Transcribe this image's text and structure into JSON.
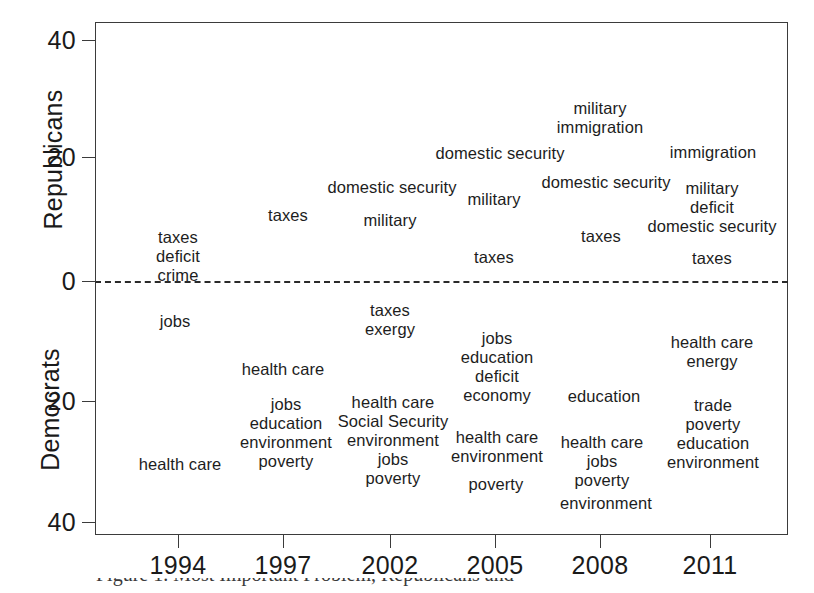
{
  "chart_data": {
    "type": "scatter",
    "title": "",
    "xlabel": "",
    "ylabel_top": "Republicans",
    "ylabel_bottom": "Democrats",
    "x_categories": [
      "1994",
      "1997",
      "2002",
      "2005",
      "2008",
      "2011"
    ],
    "x_tick_px": [
      178,
      283,
      390,
      495,
      600,
      710
    ],
    "y_ticks_top": [
      "40",
      "20",
      "0"
    ],
    "y_ticks_bottom": [
      "20",
      "40"
    ],
    "y_tick_values": [
      40,
      20,
      0,
      -20,
      -40
    ],
    "y_tick_labels": [
      "40",
      "20",
      "0",
      "20",
      "40"
    ],
    "ylim": [
      -41,
      41
    ],
    "grid": false,
    "legend": "none",
    "zero_line": "dashed",
    "series": [
      {
        "name": "Republicans",
        "year": "1994",
        "items": [
          {
            "label": "taxes",
            "value": 7
          },
          {
            "label": "deficit",
            "value": 5
          },
          {
            "label": "crime",
            "value": 2.5
          }
        ]
      },
      {
        "name": "Republicans",
        "year": "1997",
        "items": [
          {
            "label": "taxes",
            "value": 11
          }
        ]
      },
      {
        "name": "Republicans",
        "year": "2002",
        "items": [
          {
            "label": "domestic security",
            "value": 15
          },
          {
            "label": "military",
            "value": 10
          }
        ]
      },
      {
        "name": "Republicans",
        "year": "2005",
        "items": [
          {
            "label": "military",
            "value": 14
          },
          {
            "label": "taxes",
            "value": 3
          }
        ]
      },
      {
        "name": "Republicans",
        "year": "2008",
        "items": [
          {
            "label": "military",
            "value": 27
          },
          {
            "label": "immigration",
            "value": 24
          },
          {
            "label": "domestic security",
            "value": 16
          },
          {
            "label": "taxes",
            "value": 8
          }
        ]
      },
      {
        "name": "Republicans",
        "year": "2008b",
        "items": [
          {
            "label": "domestic security",
            "value": 21
          }
        ]
      },
      {
        "name": "Republicans",
        "year": "2011",
        "items": [
          {
            "label": "immigration",
            "value": 21
          },
          {
            "label": "military",
            "value": 14
          },
          {
            "label": "deficit",
            "value": 11.5
          },
          {
            "label": "domestic security",
            "value": 8.5
          },
          {
            "label": "taxes",
            "value": 2
          }
        ]
      },
      {
        "name": "Democrats",
        "year": "1994",
        "items": [
          {
            "label": "jobs",
            "value": -7
          },
          {
            "label": "health care",
            "value": -29
          }
        ]
      },
      {
        "name": "Democrats",
        "year": "1997",
        "items": [
          {
            "label": "health care",
            "value": -14
          },
          {
            "label": "jobs",
            "value": -19
          },
          {
            "label": "education",
            "value": -22
          },
          {
            "label": "environment",
            "value": -24.5
          },
          {
            "label": "poverty",
            "value": -27
          }
        ]
      },
      {
        "name": "Democrats",
        "year": "2002",
        "items": [
          {
            "label": "taxes",
            "value": -5
          },
          {
            "label": "exergy",
            "value": -8
          },
          {
            "label": "health care",
            "value": -20
          },
          {
            "label": "Social Security",
            "value": -22.5
          },
          {
            "label": "environment",
            "value": -25
          },
          {
            "label": "jobs",
            "value": -28
          },
          {
            "label": "poverty",
            "value": -31
          }
        ]
      },
      {
        "name": "Democrats",
        "year": "2005",
        "items": [
          {
            "label": "jobs",
            "value": -9
          },
          {
            "label": "education",
            "value": -12
          },
          {
            "label": "deficit",
            "value": -14.5
          },
          {
            "label": "economy",
            "value": -17
          },
          {
            "label": "health care",
            "value": -24
          },
          {
            "label": "environment",
            "value": -26
          },
          {
            "label": "poverty",
            "value": -31
          }
        ]
      },
      {
        "name": "Democrats",
        "year": "2008",
        "items": [
          {
            "label": "education",
            "value": -19
          },
          {
            "label": "health care",
            "value": -25
          },
          {
            "label": "jobs",
            "value": -27
          },
          {
            "label": "poverty",
            "value": -29
          },
          {
            "label": "environment",
            "value": -34
          }
        ]
      },
      {
        "name": "Democrats",
        "year": "2011",
        "items": [
          {
            "label": "health care",
            "value": -9
          },
          {
            "label": "energy",
            "value": -12
          },
          {
            "label": "trade",
            "value": -19
          },
          {
            "label": "poverty",
            "value": -22
          },
          {
            "label": "education",
            "value": -24.5
          },
          {
            "label": "environment",
            "value": -27
          }
        ]
      }
    ]
  },
  "axes": {
    "y_title_top": "Republicans",
    "y_title_bottom": "Democrats",
    "y_ticks": [
      {
        "label": "40",
        "top": 40
      },
      {
        "label": "20",
        "top": 157
      },
      {
        "label": "0",
        "top": 281
      },
      {
        "label": "20",
        "top": 401
      },
      {
        "label": "40",
        "top": 522
      }
    ],
    "x_ticks": [
      {
        "label": "1994",
        "left": 178
      },
      {
        "label": "1997",
        "left": 283
      },
      {
        "label": "2002",
        "left": 390
      },
      {
        "label": "2005",
        "left": 495
      },
      {
        "label": "2008",
        "left": 600
      },
      {
        "label": "2011",
        "left": 710
      }
    ]
  },
  "word_clusters": [
    {
      "id": "rep-1994",
      "left": 178,
      "top": 228,
      "words": [
        "taxes",
        "deficit",
        "crime"
      ]
    },
    {
      "id": "rep-1997",
      "left": 288,
      "top": 206,
      "words": [
        "taxes"
      ]
    },
    {
      "id": "rep-2002-security",
      "left": 392,
      "top": 178,
      "words": [
        "domestic security"
      ]
    },
    {
      "id": "rep-2002-military",
      "left": 390,
      "top": 211,
      "words": [
        "military"
      ]
    },
    {
      "id": "rep-2005-military",
      "left": 494,
      "top": 190,
      "words": [
        "military"
      ]
    },
    {
      "id": "rep-2005-taxes",
      "left": 494,
      "top": 248,
      "words": [
        "taxes"
      ]
    },
    {
      "id": "rep-2005-security",
      "left": 500,
      "top": 144,
      "words": [
        "domestic security"
      ]
    },
    {
      "id": "rep-2008-top",
      "left": 600,
      "top": 99,
      "words": [
        "military",
        "immigration"
      ]
    },
    {
      "id": "rep-2008-security",
      "left": 606,
      "top": 173,
      "words": [
        "domestic security"
      ]
    },
    {
      "id": "rep-2008-taxes",
      "left": 601,
      "top": 227,
      "words": [
        "taxes"
      ]
    },
    {
      "id": "rep-2011-immigration",
      "left": 713,
      "top": 143,
      "words": [
        "immigration"
      ]
    },
    {
      "id": "rep-2011-stack",
      "left": 712,
      "top": 179,
      "words": [
        "military",
        "deficit",
        "domestic security"
      ]
    },
    {
      "id": "rep-2011-taxes",
      "left": 712,
      "top": 249,
      "words": [
        "taxes"
      ]
    },
    {
      "id": "dem-1994-jobs",
      "left": 175,
      "top": 312,
      "words": [
        "jobs"
      ]
    },
    {
      "id": "dem-1994-health",
      "left": 180,
      "top": 455,
      "words": [
        "health care"
      ]
    },
    {
      "id": "dem-1997-health",
      "left": 283,
      "top": 360,
      "words": [
        "health care"
      ]
    },
    {
      "id": "dem-1997-stack",
      "left": 286,
      "top": 395,
      "words": [
        "jobs",
        "education",
        "environment",
        "poverty"
      ]
    },
    {
      "id": "dem-2002-top",
      "left": 390,
      "top": 301,
      "words": [
        "taxes",
        "exergy"
      ]
    },
    {
      "id": "dem-2002-stack",
      "left": 393,
      "top": 393,
      "words": [
        "health care",
        "Social Security",
        "environment",
        "jobs",
        "poverty"
      ]
    },
    {
      "id": "dem-2005-stack-a",
      "left": 497,
      "top": 329,
      "words": [
        "jobs",
        "education",
        "deficit",
        "economy"
      ]
    },
    {
      "id": "dem-2005-stack-b",
      "left": 497,
      "top": 428,
      "words": [
        "health care",
        "environment"
      ]
    },
    {
      "id": "dem-2005-poverty",
      "left": 496,
      "top": 475,
      "words": [
        "poverty"
      ]
    },
    {
      "id": "dem-2008-education",
      "left": 604,
      "top": 387,
      "words": [
        "education"
      ]
    },
    {
      "id": "dem-2008-stack",
      "left": 602,
      "top": 433,
      "words": [
        "health care",
        "jobs",
        "poverty"
      ]
    },
    {
      "id": "dem-2008-environment",
      "left": 606,
      "top": 494,
      "words": [
        "environment"
      ]
    },
    {
      "id": "dem-2011-top",
      "left": 712,
      "top": 333,
      "words": [
        "health care",
        "energy"
      ]
    },
    {
      "id": "dem-2011-stack",
      "left": 713,
      "top": 396,
      "words": [
        "trade",
        "poverty",
        "education",
        "environment"
      ]
    }
  ],
  "caption": {
    "sliver_text": "Figure 1. Most Important Problem, Republicans and Democrats"
  }
}
